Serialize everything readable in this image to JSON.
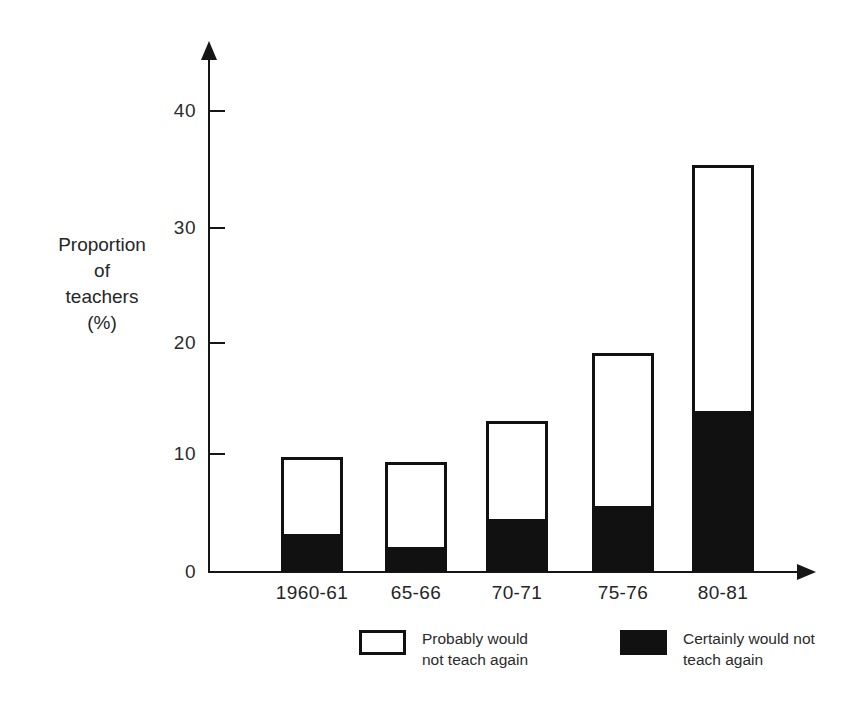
{
  "chart_data": {
    "type": "bar",
    "stacked": true,
    "title": "",
    "xlabel": "",
    "ylabel": "Proportion of teachers (%)",
    "ylabel_lines": [
      "Proportion",
      "of",
      "teachers",
      "(%)"
    ],
    "categories": [
      "1960-61",
      "65-66",
      "70-71",
      "75-76",
      "80-81"
    ],
    "series": [
      {
        "name": "Certainly would not teach again",
        "legend_lines": [
          "Certainly would not",
          "teach again"
        ],
        "color": "#111111",
        "fill": "solid",
        "values": [
          3.3,
          2.2,
          4.6,
          5.7,
          13.9
        ]
      },
      {
        "name": "Probably would not teach again",
        "legend_lines": [
          "Probably would",
          "not teach again"
        ],
        "color": "#ffffff",
        "fill": "open",
        "values": [
          6.7,
          7.3,
          8.5,
          13.3,
          21.3
        ]
      }
    ],
    "totals": [
      10.0,
      9.5,
      13.1,
      19.0,
      35.2
    ],
    "yticks": [
      0,
      10,
      20,
      30,
      40
    ],
    "ytick_labels": [
      "0",
      "10",
      "20",
      "30",
      "40"
    ],
    "ylim": [
      0,
      44
    ],
    "grid": false,
    "legend_position": "bottom"
  },
  "axes": {
    "y_title_line1": "Proportion",
    "y_title_line2": "of",
    "y_title_line3": "teachers",
    "y_title_line4": "(%)",
    "ytick0": "0",
    "ytick1": "10",
    "ytick2": "20",
    "ytick3": "30",
    "ytick4": "40"
  },
  "xlabels": {
    "b0": "1960-61",
    "b1": "65-66",
    "b2": "70-71",
    "b3": "75-76",
    "b4": "80-81"
  },
  "legend": {
    "open_line1": "Probably would",
    "open_line2": "not teach again",
    "filled_line1": "Certainly would not",
    "filled_line2": "teach again"
  }
}
